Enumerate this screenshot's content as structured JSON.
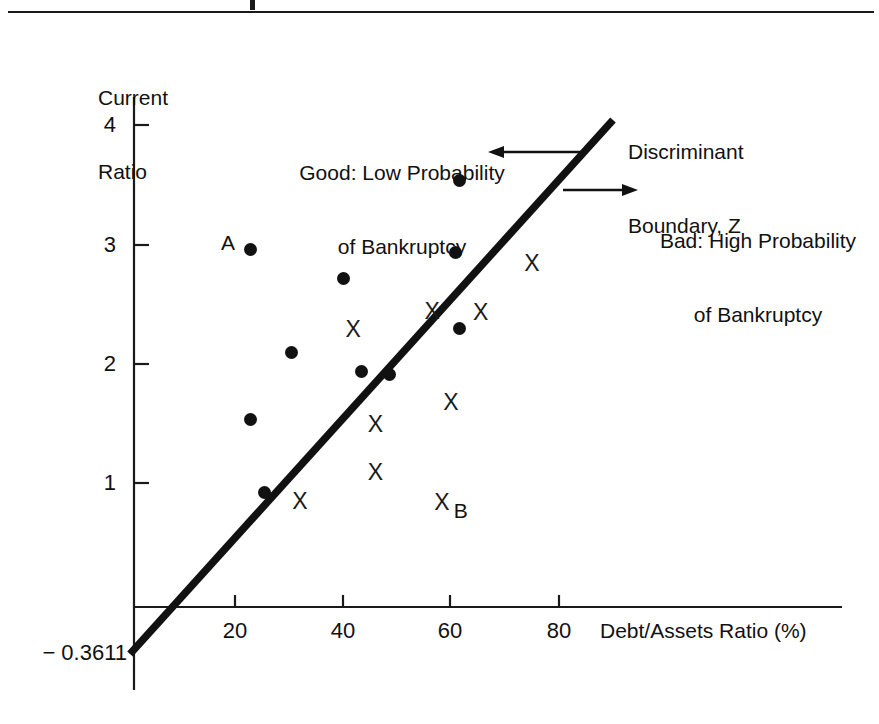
{
  "figure": {
    "title": "",
    "top_rule": true
  },
  "chart_data": {
    "type": "scatter",
    "title": "",
    "xlabel": "Debt/Assets Ratio (%)",
    "ylabel": "Current Ratio",
    "ylabel_line1": "Current",
    "ylabel_line2": "Ratio",
    "xlim": [
      0,
      88
    ],
    "ylim": [
      -0.55,
      4.45
    ],
    "grid": false,
    "legend": "none",
    "xticks": [
      20,
      40,
      60,
      80
    ],
    "xtick_labels": [
      "20",
      "40",
      "60",
      "80"
    ],
    "yticks": [
      1,
      2,
      3,
      4
    ],
    "ytick_labels": [
      "1",
      "2",
      "3",
      "4"
    ],
    "y_intercept_label": "− 0.3611",
    "series": [
      {
        "name": "Good: Low Probability of Bankruptcy",
        "marker": "filled-circle",
        "points": [
          {
            "x": 22.8,
            "y": 3.0,
            "label": "A"
          },
          {
            "x": 30.5,
            "y": 2.13,
            "label": ""
          },
          {
            "x": 22.8,
            "y": 1.57,
            "label": ""
          },
          {
            "x": 25.4,
            "y": 0.96,
            "label": ""
          },
          {
            "x": 40.0,
            "y": 2.75,
            "label": ""
          },
          {
            "x": 43.4,
            "y": 1.97,
            "label": ""
          },
          {
            "x": 48.6,
            "y": 1.95,
            "label": ""
          },
          {
            "x": 61.5,
            "y": 3.57,
            "label": ""
          },
          {
            "x": 60.9,
            "y": 2.97,
            "label": ""
          },
          {
            "x": 61.5,
            "y": 2.33,
            "label": ""
          }
        ]
      },
      {
        "name": "Bad: High Probability of Bankruptcy",
        "marker": "x",
        "points": [
          {
            "x": 41.9,
            "y": 2.33,
            "label": ""
          },
          {
            "x": 46.0,
            "y": 1.53,
            "label": ""
          },
          {
            "x": 46.0,
            "y": 1.13,
            "label": ""
          },
          {
            "x": 32.0,
            "y": 0.89,
            "label": ""
          },
          {
            "x": 56.5,
            "y": 2.48,
            "label": ""
          },
          {
            "x": 65.5,
            "y": 2.47,
            "label": ""
          },
          {
            "x": 75.0,
            "y": 2.88,
            "label": ""
          },
          {
            "x": 60.0,
            "y": 1.72,
            "label": ""
          },
          {
            "x": 58.3,
            "y": 0.88,
            "label": "B"
          }
        ]
      }
    ],
    "boundary_line": {
      "name": "Discriminant Boundary, Z",
      "x_start": 0.0,
      "y_start": -0.3611,
      "x_end": 89.5,
      "y_end": 4.08
    },
    "annotations": [
      {
        "id": "good-region",
        "line1": "Good: Low Probability",
        "line2": "of Bankruptcy",
        "arrow": "left"
      },
      {
        "id": "boundary",
        "line1": "Discriminant",
        "line2": "Boundary, Z",
        "arrow": "none"
      },
      {
        "id": "bad-region",
        "line1": "Bad: High Probability",
        "line2": "of Bankruptcy",
        "arrow": "right"
      }
    ],
    "point_labels": [
      {
        "text": "A",
        "for_point": "good-0"
      },
      {
        "text": "B",
        "for_point": "bad-8"
      }
    ]
  },
  "colors": {
    "ink": "#111111",
    "axis": "#1a1a1a",
    "background": "#ffffff"
  }
}
